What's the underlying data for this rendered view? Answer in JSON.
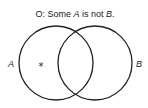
{
  "title": {
    "prefix": "O:  Some ",
    "subject": "A",
    "middle": " is not ",
    "predicate": "B",
    "suffix": "."
  },
  "sets": [
    {
      "id": "A",
      "label": "A"
    },
    {
      "id": "B",
      "label": "B"
    }
  ],
  "marker": {
    "symbol": "*",
    "region": "A only (A and not B)"
  },
  "colors": {
    "stroke": "#222222",
    "background": "#ffffff"
  }
}
